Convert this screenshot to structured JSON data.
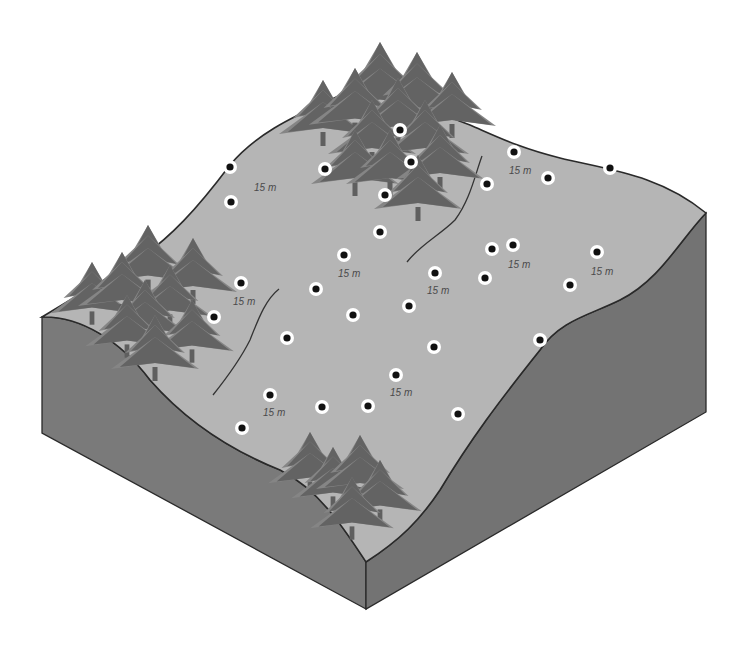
{
  "diagram": {
    "colors": {
      "background": "#ffffff",
      "surface": "#b5b5b5",
      "side": "#7a7a7a",
      "outline": "#2a2a2a",
      "tree_dark": "#5f5f5f",
      "tree_light": "#858585",
      "marker_ring": "#ffffff",
      "marker_dot": "#111111",
      "label": "#4a4a4a",
      "contour": "#333333"
    },
    "distance_label": "15 m",
    "plot_markers": [
      [
        230,
        167
      ],
      [
        325,
        169
      ],
      [
        400,
        130
      ],
      [
        411,
        162
      ],
      [
        385,
        195
      ],
      [
        231,
        202
      ],
      [
        514,
        152
      ],
      [
        487,
        184
      ],
      [
        548,
        178
      ],
      [
        610,
        168
      ],
      [
        380,
        232
      ],
      [
        344,
        255
      ],
      [
        241,
        283
      ],
      [
        316,
        289
      ],
      [
        214,
        317
      ],
      [
        435,
        273
      ],
      [
        409,
        306
      ],
      [
        353,
        315
      ],
      [
        287,
        338
      ],
      [
        492,
        249
      ],
      [
        513,
        245
      ],
      [
        485,
        278
      ],
      [
        597,
        252
      ],
      [
        570,
        285
      ],
      [
        540,
        340
      ],
      [
        434,
        347
      ],
      [
        396,
        375
      ],
      [
        270,
        395
      ],
      [
        322,
        407
      ],
      [
        368,
        406
      ],
      [
        242,
        428
      ],
      [
        458,
        414
      ]
    ],
    "distance_labels": [
      {
        "x": 254,
        "y": 191,
        "text": "15 m"
      },
      {
        "x": 509,
        "y": 174,
        "text": "15 m"
      },
      {
        "x": 338,
        "y": 277,
        "text": "15 m"
      },
      {
        "x": 233,
        "y": 305,
        "text": "15 m"
      },
      {
        "x": 427,
        "y": 294,
        "text": "15 m"
      },
      {
        "x": 508,
        "y": 268,
        "text": "15 m"
      },
      {
        "x": 591,
        "y": 275,
        "text": "15 m"
      },
      {
        "x": 390,
        "y": 396,
        "text": "15 m"
      },
      {
        "x": 263,
        "y": 416,
        "text": "15 m"
      }
    ],
    "tree_groups": [
      {
        "name": "north-forest",
        "trees": [
          [
            380,
            42,
            1.2
          ],
          [
            417,
            52,
            1.15
          ],
          [
            323,
            80,
            1.0
          ],
          [
            355,
            68,
            1.05
          ],
          [
            398,
            78,
            1.0
          ],
          [
            452,
            72,
            1.0
          ],
          [
            372,
            100,
            1.0
          ],
          [
            425,
            100,
            1.0
          ],
          [
            355,
            130,
            1.0
          ],
          [
            390,
            130,
            1.0
          ],
          [
            440,
            125,
            1.0
          ],
          [
            418,
            155,
            1.0
          ]
        ]
      },
      {
        "name": "west-forest",
        "trees": [
          [
            148,
            225,
            1.05
          ],
          [
            92,
            262,
            0.95
          ],
          [
            122,
            252,
            1.0
          ],
          [
            193,
            238,
            1.0
          ],
          [
            170,
            265,
            0.95
          ],
          [
            145,
            280,
            1.0
          ],
          [
            127,
            295,
            0.95
          ],
          [
            192,
            300,
            0.95
          ],
          [
            155,
            315,
            1.0
          ]
        ]
      },
      {
        "name": "south-forest",
        "trees": [
          [
            310,
            432,
            0.95
          ],
          [
            333,
            447,
            0.95
          ],
          [
            360,
            435,
            1.0
          ],
          [
            380,
            460,
            0.95
          ],
          [
            352,
            477,
            0.95
          ]
        ]
      }
    ]
  }
}
